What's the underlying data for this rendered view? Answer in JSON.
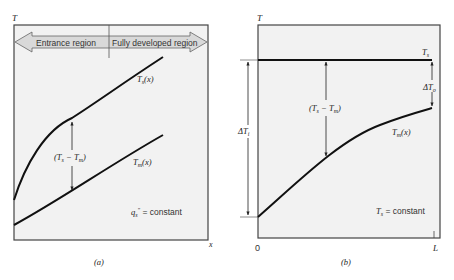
{
  "panel_a": {
    "y_axis_label": "T",
    "x_axis_label": "x",
    "caption": "(a)",
    "banner": {
      "left_label": "Entrance region",
      "right_label": "Fully developed region"
    },
    "curves": {
      "surface": "T_s(x)",
      "mean": "T_m(x)"
    },
    "difference_label": "(T_s − T_m)",
    "condition": "q_s'' = constant",
    "colors": {
      "panel_fill": "#f2f2f2",
      "banner_fill": "#d9d9d9",
      "line": "#111111"
    }
  },
  "panel_b": {
    "y_axis_label": "T",
    "x_start_label": "0",
    "x_end_label": "L",
    "caption": "(b)",
    "curves": {
      "surface": "T_s",
      "mean": "T_m(x)"
    },
    "difference_label": "(T_s − T_m)",
    "delta_inlet": "ΔT_i",
    "delta_outlet": "ΔT_o",
    "condition": "T_s = constant",
    "colors": {
      "panel_fill": "#f2f2f2",
      "line": "#111111"
    }
  }
}
